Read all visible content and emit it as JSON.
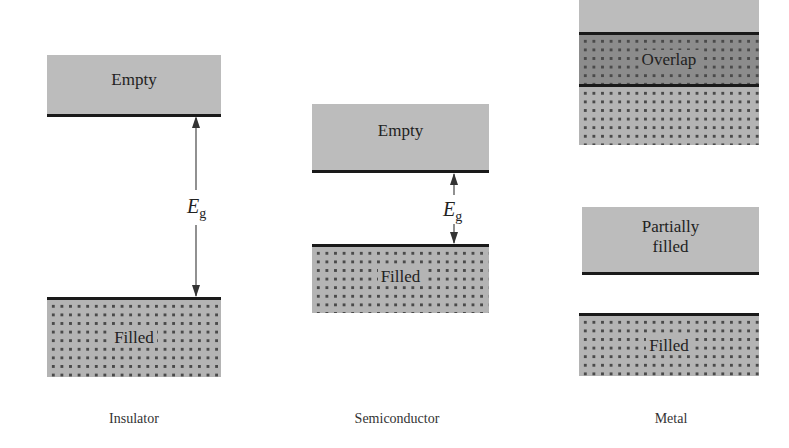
{
  "figure": {
    "columns": [
      {
        "name": "Insulator",
        "bands": [
          {
            "label": "Empty",
            "type": "empty"
          },
          {
            "label": "Filled",
            "type": "filled"
          }
        ],
        "gap_label": {
          "symbol": "E",
          "subscript": "g"
        }
      },
      {
        "name": "Semiconductor",
        "bands": [
          {
            "label": "Empty",
            "type": "empty"
          },
          {
            "label": "Filled",
            "type": "filled"
          }
        ],
        "gap_label": {
          "symbol": "E",
          "subscript": "g"
        }
      },
      {
        "name": "Metal",
        "bands": [
          {
            "label": "Overlap",
            "type": "overlap"
          },
          {
            "label": "Partially filled",
            "label_line1": "Partially",
            "label_line2": "filled",
            "type": "partial"
          },
          {
            "label": "Filled",
            "type": "filled"
          }
        ]
      }
    ]
  },
  "colors": {
    "empty_band": "#bcbcbc",
    "filled_band": "#b4b4b4",
    "overlap_band": "#8c8c8c",
    "dots": "#4a4a4a",
    "edge_line": "#1a1a1a"
  }
}
